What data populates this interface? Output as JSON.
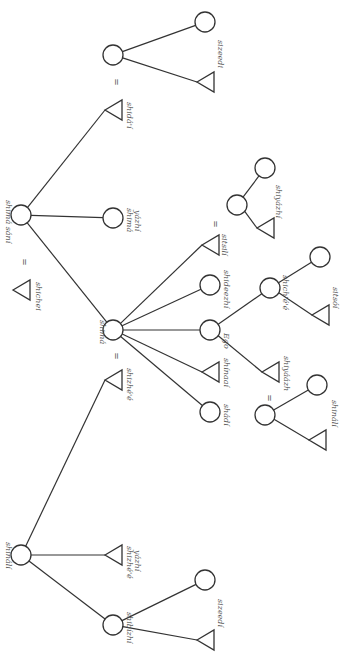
{
  "diagram": {
    "type": "kinship-chart",
    "orientation": "rotated-90-clockwise",
    "colors": {
      "line": "#333333",
      "label": "#555555",
      "background": "#ffffff"
    },
    "nodes": [
      {
        "id": "shima_sani",
        "shape": "circle",
        "x": 21,
        "y": 215,
        "label": "shimá sání"
      },
      {
        "id": "shicheii",
        "shape": "triangle",
        "x": 21,
        "y": 290,
        "label": "shichei"
      },
      {
        "id": "shima_yazhi",
        "shape": "circle",
        "x": 113,
        "y": 218,
        "label": "shimá yázhí"
      },
      {
        "id": "shidai",
        "shape": "triangle",
        "x": 113,
        "y": 110,
        "label": "shidá'í"
      },
      {
        "id": "shidai_wife",
        "shape": "circle",
        "x": 113,
        "y": 55,
        "label": ""
      },
      {
        "id": "sizeedi_top_f",
        "shape": "circle",
        "x": 205,
        "y": 22,
        "label": ""
      },
      {
        "id": "sizeedi_top_m",
        "shape": "triangle",
        "x": 205,
        "y": 82,
        "label": "sizeedí"
      },
      {
        "id": "shima",
        "shape": "circle",
        "x": 113,
        "y": 330,
        "label": "shimá"
      },
      {
        "id": "shizhee",
        "shape": "triangle",
        "x": 113,
        "y": 380,
        "label": "shizhé'é"
      },
      {
        "id": "sitsili",
        "shape": "triangle",
        "x": 210,
        "y": 245,
        "label": "sitsilí"
      },
      {
        "id": "sitsili_wife",
        "shape": "circle",
        "x": 237,
        "y": 205,
        "label": ""
      },
      {
        "id": "shiyazhi_f",
        "shape": "circle",
        "x": 265,
        "y": 168,
        "label": ""
      },
      {
        "id": "shiyazhi_m",
        "shape": "triangle",
        "x": 265,
        "y": 228,
        "label": "shiyázhí"
      },
      {
        "id": "shideezhi",
        "shape": "circle",
        "x": 210,
        "y": 285,
        "label": "shideezhí"
      },
      {
        "id": "ego",
        "shape": "circle",
        "x": 210,
        "y": 330,
        "label": "Ego"
      },
      {
        "id": "shichee",
        "shape": "circle",
        "x": 270,
        "y": 288,
        "label": "shich'é'é"
      },
      {
        "id": "sitsoi_f",
        "shape": "circle",
        "x": 320,
        "y": 257,
        "label": ""
      },
      {
        "id": "sitsoi_m",
        "shape": "triangle",
        "x": 320,
        "y": 315,
        "label": "sitsóí"
      },
      {
        "id": "shiyaazh",
        "shape": "triangle",
        "x": 270,
        "y": 372,
        "label": "shiyáázh"
      },
      {
        "id": "shiyaazh_wife",
        "shape": "circle",
        "x": 265,
        "y": 415,
        "label": ""
      },
      {
        "id": "shinali_gc_f",
        "shape": "circle",
        "x": 317,
        "y": 385,
        "label": ""
      },
      {
        "id": "shinali_gc_m",
        "shape": "triangle",
        "x": 317,
        "y": 440,
        "label": "shinálí"
      },
      {
        "id": "shinaai",
        "shape": "triangle",
        "x": 210,
        "y": 372,
        "label": "shínaaí"
      },
      {
        "id": "shadi",
        "shape": "circle",
        "x": 210,
        "y": 412,
        "label": "shádí"
      },
      {
        "id": "shinali",
        "shape": "circle",
        "x": 21,
        "y": 555,
        "label": "shinálí"
      },
      {
        "id": "shizhee_yazhi",
        "shape": "triangle",
        "x": 113,
        "y": 555,
        "label": "shizhé'é yázhí"
      },
      {
        "id": "shibizhi",
        "shape": "circle",
        "x": 113,
        "y": 625,
        "label": "shibízhí"
      },
      {
        "id": "sizeedi_bot_f",
        "shape": "circle",
        "x": 205,
        "y": 580,
        "label": ""
      },
      {
        "id": "sizeedi_bot_m",
        "shape": "triangle",
        "x": 205,
        "y": 640,
        "label": "sizeedí"
      }
    ],
    "marriages": [
      {
        "x": 21,
        "y": 262,
        "symbol": "="
      },
      {
        "x": 113,
        "y": 82,
        "symbol": "="
      },
      {
        "x": 113,
        "y": 356,
        "symbol": "="
      },
      {
        "x": 212,
        "y": 224,
        "symbol": "="
      },
      {
        "x": 266,
        "y": 398,
        "symbol": "="
      }
    ],
    "edges": [
      [
        "shima_sani",
        "shidai"
      ],
      [
        "shima_sani",
        "shima_yazhi"
      ],
      [
        "shima_sani",
        "shima"
      ],
      [
        "shidai_wife",
        "sizeedi_top_f"
      ],
      [
        "shidai_wife",
        "sizeedi_top_m"
      ],
      [
        "shima",
        "sitsili"
      ],
      [
        "shima",
        "shideezhi"
      ],
      [
        "shima",
        "ego"
      ],
      [
        "shima",
        "shinaai"
      ],
      [
        "shima",
        "shadi"
      ],
      [
        "sitsili_wife",
        "shiyazhi_f"
      ],
      [
        "sitsili_wife",
        "shiyazhi_m"
      ],
      [
        "ego",
        "shichee"
      ],
      [
        "ego",
        "shiyaazh"
      ],
      [
        "shichee",
        "sitsoi_f"
      ],
      [
        "shichee",
        "sitsoi_m"
      ],
      [
        "shiyaazh_wife",
        "shinali_gc_f"
      ],
      [
        "shiyaazh_wife",
        "shinali_gc_m"
      ],
      [
        "shinali",
        "shizhee"
      ],
      [
        "shinali",
        "shizhee_yazhi"
      ],
      [
        "shinali",
        "shibizhi"
      ],
      [
        "shibizhi",
        "sizeedi_bot_f"
      ],
      [
        "shibizhi",
        "sizeedi_bot_m"
      ]
    ],
    "labels": [
      {
        "text": "shimá sání",
        "x": 6,
        "y": 200,
        "rot": 90
      },
      {
        "text": "shichei",
        "x": 36,
        "y": 282,
        "rot": 90
      },
      {
        "text": "shimá",
        "x": 127,
        "y": 208,
        "rot": 90
      },
      {
        "text": "yázhí",
        "x": 135,
        "y": 210,
        "rot": 90
      },
      {
        "text": "shidá'í",
        "x": 127,
        "y": 102,
        "rot": 90
      },
      {
        "text": "sizeedi",
        "x": 218,
        "y": 40,
        "rot": 90
      },
      {
        "text": "shimá",
        "x": 100,
        "y": 320,
        "rot": 90
      },
      {
        "text": "shizhé'é",
        "x": 127,
        "y": 368,
        "rot": 90
      },
      {
        "text": "sitsilí",
        "x": 222,
        "y": 234,
        "rot": 90
      },
      {
        "text": "shiyázhí",
        "x": 276,
        "y": 185,
        "rot": 90
      },
      {
        "text": "shideezhí",
        "x": 224,
        "y": 270,
        "rot": 90
      },
      {
        "text": "Ego",
        "x": 224,
        "y": 333,
        "rot": 90
      },
      {
        "text": "shich'é'é",
        "x": 283,
        "y": 275,
        "rot": 90
      },
      {
        "text": "sitsóí",
        "x": 333,
        "y": 287,
        "rot": 90
      },
      {
        "text": "shiyáázh",
        "x": 284,
        "y": 356,
        "rot": 90
      },
      {
        "text": "shinálí",
        "x": 332,
        "y": 400,
        "rot": 90
      },
      {
        "text": "shínaaí",
        "x": 224,
        "y": 358,
        "rot": 90
      },
      {
        "text": "shádí",
        "x": 224,
        "y": 404,
        "rot": 90
      },
      {
        "text": "shinálí",
        "x": 6,
        "y": 542,
        "rot": 90
      },
      {
        "text": "shizhé'é",
        "x": 127,
        "y": 546,
        "rot": 90
      },
      {
        "text": "yázhí",
        "x": 135,
        "y": 550,
        "rot": 90
      },
      {
        "text": "shibízhí",
        "x": 127,
        "y": 612,
        "rot": 90
      },
      {
        "text": "sizeedí",
        "x": 218,
        "y": 599,
        "rot": 90
      }
    ]
  }
}
